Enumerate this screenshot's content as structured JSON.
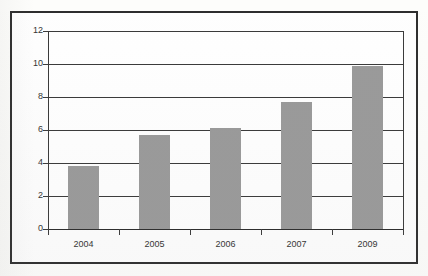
{
  "chart_data": {
    "type": "bar",
    "title": "",
    "subtitle": "",
    "xlabel": "",
    "ylabel": "",
    "categories": [
      "2004",
      "2005",
      "2006",
      "2007",
      "2009"
    ],
    "values": [
      3.8,
      5.7,
      6.1,
      7.7,
      9.9
    ],
    "series": [
      {
        "name": "",
        "values": [
          3.8,
          5.7,
          6.1,
          7.7,
          9.9
        ]
      }
    ],
    "ylim": [
      0,
      12
    ],
    "ytick_labels": [
      "0",
      "2",
      "4",
      "6",
      "8",
      "10",
      "12"
    ],
    "ytick_values": [
      0,
      2,
      4,
      6,
      8,
      10,
      12
    ],
    "grid": true,
    "grid_axis": "y",
    "legend": false,
    "legend_position": "none",
    "bar_color": "#9a9a9a",
    "axis_color": "#3a3a3a",
    "frame_color": "#2e2e2e",
    "background_color": "#fefefe",
    "annotations": []
  }
}
